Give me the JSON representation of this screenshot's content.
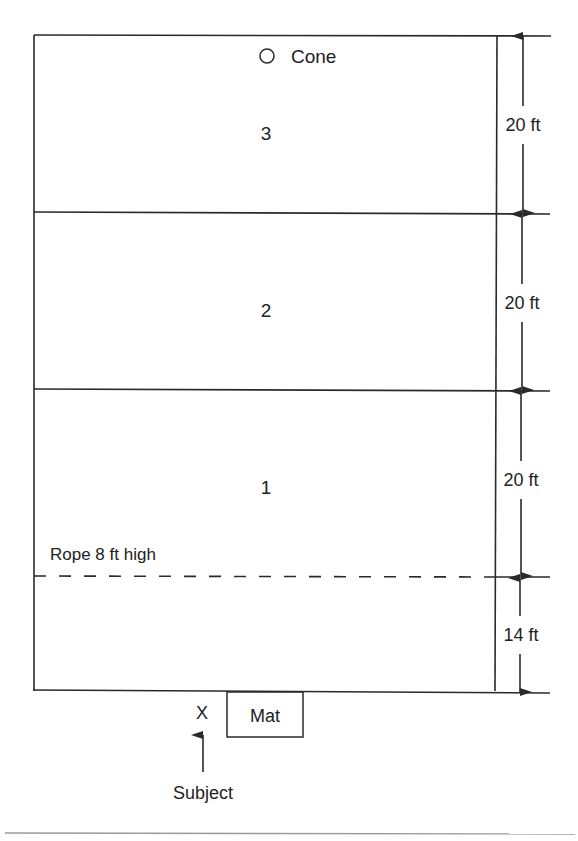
{
  "diagram": {
    "zones": [
      {
        "label": "3",
        "dimension": "20 ft"
      },
      {
        "label": "2",
        "dimension": "20 ft"
      },
      {
        "label": "1",
        "dimension": "20 ft"
      },
      {
        "label": "",
        "dimension": "14 ft"
      }
    ],
    "cone": {
      "label": "Cone"
    },
    "rope": {
      "label": "Rope 8 ft high"
    },
    "mat": {
      "label": "Mat"
    },
    "subject": {
      "marker": "X",
      "label": "Subject"
    }
  },
  "colors": {
    "line": "#2a2a2a",
    "text": "#222222",
    "rule": "#9a9a9a",
    "background": "#ffffff"
  }
}
